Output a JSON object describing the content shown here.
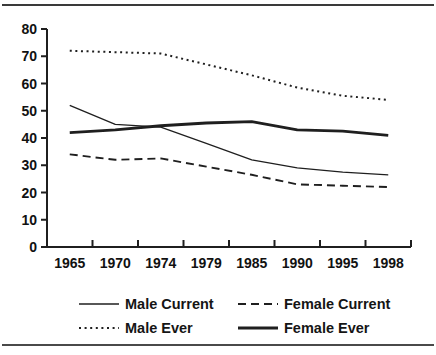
{
  "figure": {
    "background": "#ffffff",
    "line_color": "#1f1f1f",
    "divider_color": "#3a3a3a"
  },
  "chart_data": {
    "type": "line",
    "title": "",
    "xlabel": "",
    "ylabel": "",
    "categories": [
      "1965",
      "1970",
      "1974",
      "1979",
      "1985",
      "1990",
      "1995",
      "1998"
    ],
    "ylim": [
      0,
      80
    ],
    "ytick_step": 10,
    "ytick_labels": [
      "0",
      "10",
      "20",
      "30",
      "40",
      "50",
      "60",
      "70",
      "80"
    ],
    "grid": false,
    "legend_position": "bottom",
    "series": [
      {
        "name": "Male Current",
        "line_style": "solid-thin",
        "values": [
          52,
          45,
          44,
          38,
          32,
          29,
          27.5,
          26.5
        ]
      },
      {
        "name": "Female Current",
        "line_style": "dashed",
        "values": [
          34,
          32,
          32.5,
          29.5,
          26.5,
          23,
          22.5,
          22
        ]
      },
      {
        "name": "Male Ever",
        "line_style": "dotted",
        "values": [
          72,
          71.5,
          71,
          67,
          63,
          58.5,
          55.5,
          54
        ]
      },
      {
        "name": "Female Ever",
        "line_style": "solid-thick",
        "values": [
          42,
          43,
          44.5,
          45.5,
          46,
          43,
          42.5,
          41
        ]
      }
    ]
  }
}
